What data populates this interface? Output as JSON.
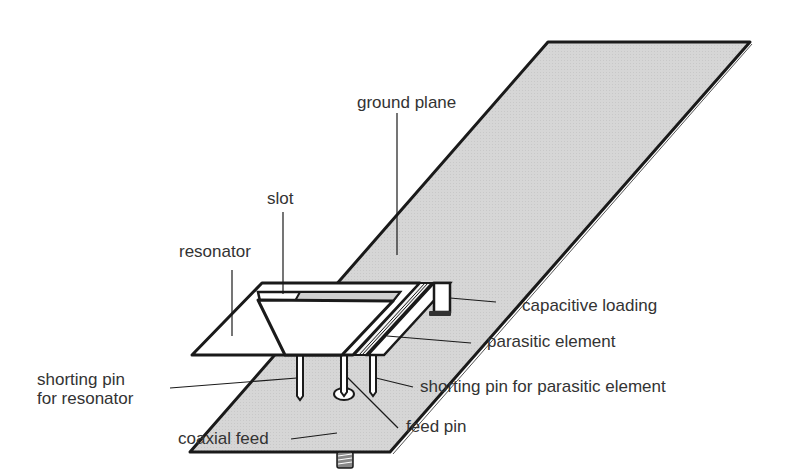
{
  "figure": {
    "colors": {
      "ground_fill": "#d4d4d4",
      "outline": "#1a1a1a",
      "element_fill": "#ffffff",
      "text": "#333333"
    }
  },
  "labels": {
    "ground_plane": "ground plane",
    "slot": "slot",
    "resonator": "resonator",
    "capacitive_loading": "capacitive loading",
    "parasitic_element": "parasitic element",
    "shorting_pin_resonator": "shorting pin\nfor resonator",
    "shorting_pin_parasitic": "shorting pin for parasitic element",
    "coaxial_feed": "coaxial feed",
    "feed_pin": "feed pin"
  }
}
